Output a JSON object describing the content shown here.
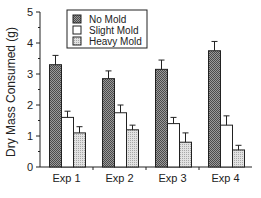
{
  "chart_data": {
    "type": "bar",
    "title": "",
    "xlabel": "",
    "ylabel": "Dry Mass Consumed (g)",
    "ylim": [
      0,
      5
    ],
    "yticks": [
      0,
      1,
      2,
      3,
      4,
      5
    ],
    "grid": false,
    "legend_position": "top-right",
    "categories": [
      "Exp 1",
      "Exp 2",
      "Exp 3",
      "Exp 4"
    ],
    "series": [
      {
        "name": "No Mold",
        "values": [
          3.3,
          2.85,
          3.15,
          3.75
        ],
        "errors": [
          0.3,
          0.25,
          0.3,
          0.3
        ],
        "fill": "dark-crosshatch"
      },
      {
        "name": "Slight Mold",
        "values": [
          1.6,
          1.75,
          1.4,
          1.35
        ],
        "errors": [
          0.2,
          0.25,
          0.2,
          0.3
        ],
        "fill": "white"
      },
      {
        "name": "Heavy Mold",
        "values": [
          1.1,
          1.2,
          0.8,
          0.55
        ],
        "errors": [
          0.2,
          0.15,
          0.3,
          0.15
        ],
        "fill": "light-stipple"
      }
    ]
  }
}
